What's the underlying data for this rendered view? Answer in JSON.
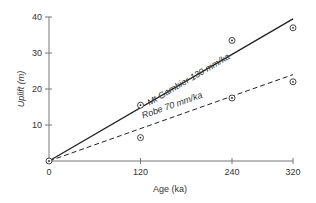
{
  "chart_data": {
    "type": "scatter",
    "title": "",
    "xlabel": "Age (ka)",
    "ylabel": "Uplift (m)",
    "xlim": [
      0,
      320
    ],
    "ylim": [
      0,
      40
    ],
    "x_ticks": [
      0,
      120,
      240,
      320
    ],
    "y_ticks": [
      0,
      10,
      20,
      30,
      40
    ],
    "x_tick_labels": [
      "0",
      "120",
      "240",
      "320"
    ],
    "y_tick_labels": [
      "10",
      "20",
      "30",
      "40"
    ],
    "grid": false,
    "legend": null,
    "series": [
      {
        "name": "Mt Gambier",
        "points": [
          [
            0,
            0
          ],
          [
            120,
            15.5
          ],
          [
            240,
            33.5
          ],
          [
            320,
            37
          ]
        ],
        "trend_line": {
          "style": "solid",
          "rate_mm_per_ka": 130,
          "from": [
            0,
            0
          ],
          "to": [
            320,
            39.5
          ]
        },
        "label": "Mt Gambier 130 mm/ka"
      },
      {
        "name": "Robe",
        "points": [
          [
            0,
            0
          ],
          [
            120,
            6.5
          ],
          [
            240,
            17.5
          ],
          [
            320,
            22
          ]
        ],
        "trend_line": {
          "style": "dashed",
          "rate_mm_per_ka": 70,
          "from": [
            0,
            0
          ],
          "to": [
            320,
            24
          ]
        },
        "label": "Robe 70 mm/ka"
      }
    ],
    "marker": "circled-dot",
    "colors": {
      "axis": "#777777",
      "line": "#222222",
      "text": "#333333"
    }
  }
}
